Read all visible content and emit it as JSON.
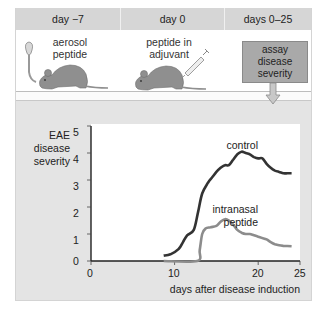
{
  "timeline": {
    "columns": [
      {
        "label": "day −7",
        "caption": "aerosol\npeptide",
        "caption_lines": [
          "aerosol",
          "peptide"
        ],
        "icon": "aerosol-inhaler-icon"
      },
      {
        "label": "day 0",
        "caption_lines": [
          "peptide in",
          "adjuvant"
        ],
        "icon": "syringe-icon"
      },
      {
        "label": "days 0–25",
        "box_lines": [
          "assay",
          "disease",
          "severity"
        ],
        "icon": "down-arrow-icon"
      }
    ]
  },
  "colors": {
    "header_bg": "#d6d6d6",
    "panel_bg": "#e4e4e4",
    "mouse": "#8f8f8f",
    "control_line": "#333333",
    "intranasal_line": "#8c8c8c",
    "assay_box": "#a9a9a9"
  },
  "chart_data": {
    "type": "line",
    "title": "",
    "ylabel": "EAE disease severity",
    "ylabel_lines": [
      "EAE",
      "disease",
      "severity"
    ],
    "xlabel": "days after disease induction",
    "xlim": [
      0,
      25
    ],
    "ylim": [
      0,
      5
    ],
    "xticks": [
      0,
      10,
      20,
      25
    ],
    "yticks": [
      0,
      1,
      2,
      3,
      4,
      5
    ],
    "grid": false,
    "legend": "inline labels",
    "series": [
      {
        "name": "control",
        "x": [
          8.7,
          9.5,
          10.5,
          11,
          11.5,
          12.3,
          12.8,
          13.3,
          14,
          14.5,
          15,
          15.5,
          16,
          16.5,
          17,
          17.5,
          18,
          18.5,
          19,
          19.5,
          20,
          20.5,
          21,
          21.5,
          22,
          22.5,
          23,
          23.5,
          24
        ],
        "y": [
          0.2,
          0.25,
          0.45,
          0.7,
          0.95,
          1.15,
          1.8,
          2.5,
          2.9,
          3.1,
          3.3,
          3.45,
          3.55,
          3.55,
          3.75,
          3.95,
          4.05,
          4.0,
          3.95,
          3.85,
          3.8,
          3.8,
          3.6,
          3.45,
          3.35,
          3.3,
          3.25,
          3.25,
          3.25
        ]
      },
      {
        "name": "intranasal peptide",
        "x": [
          8.7,
          12.7,
          13.0,
          13.3,
          13.7,
          14.3,
          15,
          15.5,
          16,
          16.5,
          17,
          17.5,
          18,
          18.5,
          19,
          19.5,
          20,
          20.5,
          21,
          21.5,
          22,
          22.5,
          23,
          24
        ],
        "y": [
          0.0,
          0.0,
          0.4,
          1.0,
          1.2,
          1.25,
          1.3,
          1.45,
          1.55,
          1.5,
          1.35,
          1.15,
          1.05,
          1.0,
          1.0,
          0.95,
          0.9,
          0.85,
          0.8,
          0.7,
          0.62,
          0.58,
          0.56,
          0.55
        ]
      }
    ]
  }
}
